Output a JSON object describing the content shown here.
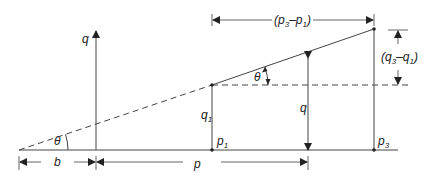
{
  "diagram": {
    "type": "geometry",
    "labels": {
      "q_axis": "q",
      "theta_left": "θ",
      "theta_right": "θ",
      "b": "b",
      "p": "p",
      "q1": "q",
      "q1_sub": "1",
      "p1": "p",
      "p1_sub": "1",
      "q_mid": "q",
      "p3": "p",
      "p3_sub": "3",
      "dp_open": "(p",
      "dp_sub3": "3",
      "dp_minus": "–p",
      "dp_sub1": "1",
      "dp_close": ")",
      "dq_open": "(q",
      "dq_sub3": "3",
      "dq_minus": "–q",
      "dq_sub1": "1",
      "dq_close": ")"
    },
    "colors": {
      "line": "#444444",
      "background": "#ffffff"
    }
  }
}
